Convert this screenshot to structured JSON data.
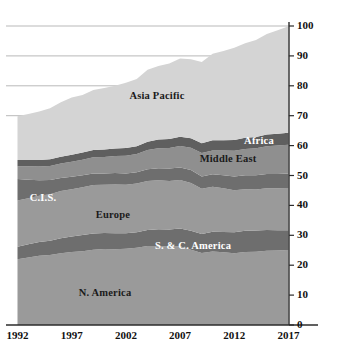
{
  "chart_data": {
    "type": "area",
    "stacked": true,
    "title": "",
    "xlabel": "",
    "ylabel": "Oil daily consumption (million barrels)",
    "x": [
      1992,
      1993,
      1994,
      1995,
      1996,
      1997,
      1998,
      1999,
      2000,
      2001,
      2002,
      2003,
      2004,
      2005,
      2006,
      2007,
      2008,
      2009,
      2010,
      2011,
      2012,
      2013,
      2014,
      2015,
      2016,
      2017
    ],
    "xlim": [
      1992,
      2017
    ],
    "ylim": [
      0,
      100
    ],
    "xticks": [
      "1992",
      "1997",
      "2002",
      "2007",
      "2012",
      "2017"
    ],
    "yticks": [
      "0",
      "10",
      "20",
      "30",
      "40",
      "50",
      "60",
      "70",
      "80",
      "90",
      "100"
    ],
    "grid": "horizontal",
    "legend_position": "inline-labels",
    "series": [
      {
        "name": "N. America",
        "color": "#9a9a9a",
        "label_color": "dark",
        "values": [
          22.0,
          22.6,
          23.2,
          23.4,
          24.0,
          24.4,
          24.7,
          25.2,
          25.4,
          25.3,
          25.5,
          25.8,
          26.4,
          26.4,
          26.2,
          26.3,
          25.2,
          24.1,
          24.6,
          24.3,
          24.0,
          24.4,
          24.5,
          24.8,
          24.9,
          25.1
        ]
      },
      {
        "name": "S. & C. America",
        "color": "#6e6e6e",
        "label_color": "light",
        "values": [
          4.2,
          4.4,
          4.6,
          4.8,
          5.0,
          5.2,
          5.4,
          5.4,
          5.4,
          5.4,
          5.2,
          5.2,
          5.4,
          5.6,
          5.7,
          6.0,
          6.3,
          6.3,
          6.6,
          6.8,
          7.0,
          7.1,
          7.1,
          7.0,
          6.8,
          6.6
        ]
      },
      {
        "name": "Europe",
        "color": "#9a9a9a",
        "label_color": "dark",
        "values": [
          15.4,
          15.4,
          15.4,
          15.5,
          15.8,
          15.8,
          16.0,
          16.2,
          16.1,
          16.3,
          16.2,
          16.3,
          16.4,
          16.4,
          16.3,
          16.2,
          16.0,
          15.2,
          15.0,
          14.6,
          14.1,
          13.9,
          13.7,
          13.9,
          14.0,
          14.1
        ]
      },
      {
        "name": "C.I.S.",
        "color": "#6e6e6e",
        "label_color": "light",
        "values": [
          7.2,
          6.2,
          5.2,
          4.8,
          4.4,
          4.2,
          4.0,
          3.9,
          3.8,
          3.8,
          3.8,
          3.8,
          3.9,
          4.0,
          4.1,
          4.2,
          4.3,
          4.1,
          4.2,
          4.4,
          4.6,
          4.7,
          4.8,
          4.8,
          4.8,
          4.9
        ]
      },
      {
        "name": "Middle East",
        "color": "#8f8f8f",
        "label_color": "dark",
        "values": [
          4.3,
          4.5,
          4.6,
          4.7,
          4.8,
          5.0,
          5.2,
          5.4,
          5.5,
          5.7,
          5.9,
          6.1,
          6.4,
          6.7,
          6.9,
          7.2,
          7.5,
          7.8,
          8.0,
          8.3,
          8.6,
          8.8,
          9.0,
          9.3,
          9.5,
          9.6
        ]
      },
      {
        "name": "Africa",
        "color": "#5f5f5f",
        "label_color": "light",
        "values": [
          2.1,
          2.1,
          2.2,
          2.2,
          2.3,
          2.3,
          2.4,
          2.4,
          2.5,
          2.5,
          2.6,
          2.6,
          2.8,
          2.9,
          3.0,
          3.1,
          3.2,
          3.3,
          3.4,
          3.4,
          3.6,
          3.7,
          3.8,
          3.9,
          4.0,
          4.0
        ]
      },
      {
        "name": "Asia Pacific",
        "color": "#d4d4d4",
        "label_color": "dark",
        "values": [
          14.6,
          15.4,
          16.2,
          17.1,
          18.2,
          19.2,
          19.2,
          20.1,
          20.6,
          21.0,
          21.8,
          22.5,
          24.1,
          24.6,
          25.3,
          26.1,
          26.4,
          27.2,
          28.9,
          29.8,
          30.8,
          31.6,
          32.4,
          33.6,
          34.6,
          35.6
        ]
      }
    ],
    "series_labels": [
      {
        "name": "Asia Pacific",
        "x": 157,
        "y": 95,
        "color": "dark"
      },
      {
        "name": "Africa",
        "x": 259,
        "y": 140,
        "color": "light"
      },
      {
        "name": "Middle East",
        "x": 228,
        "y": 158,
        "color": "dark"
      },
      {
        "name": "C.I.S.",
        "x": 43,
        "y": 197,
        "color": "light"
      },
      {
        "name": "Europe",
        "x": 113,
        "y": 214,
        "color": "dark"
      },
      {
        "name": "S. & C. America",
        "x": 193,
        "y": 245,
        "color": "light"
      },
      {
        "name": "N. America",
        "x": 105,
        "y": 292,
        "color": "dark"
      }
    ]
  },
  "axes": {
    "y_title": "Oil daily consumption (million barrels)"
  }
}
